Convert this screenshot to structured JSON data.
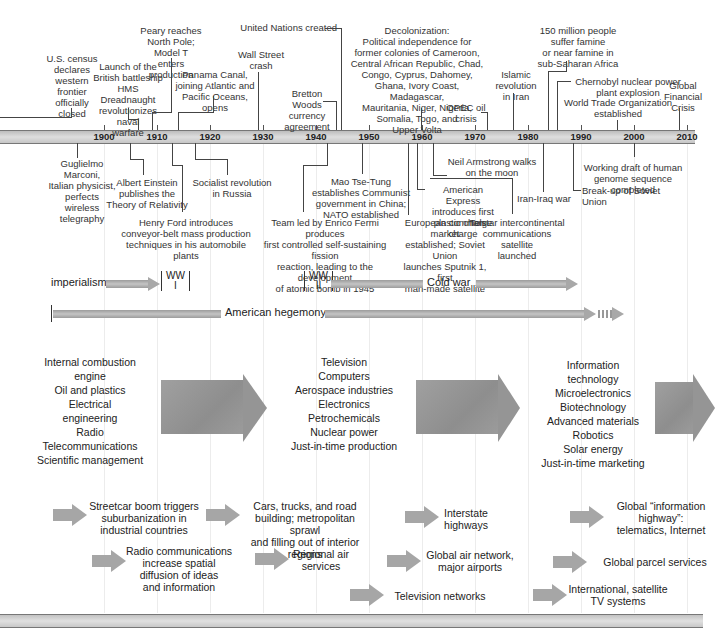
{
  "axis": {
    "years": [
      "1900",
      "1910",
      "1920",
      "1930",
      "1940",
      "1950",
      "1960",
      "1970",
      "1980",
      "1990",
      "2000",
      "2010"
    ]
  },
  "events_above": [
    {
      "text": "U.S. census\ndeclares\nwestern\nfrontier\nofficially\nclosed"
    },
    {
      "text": "Launch of the\nBritish battleship\nHMS Dreadnaught\nrevolutionizes naval\nwarfare"
    },
    {
      "text": "Peary reaches\nNorth Pole;\nModel T enters\nproduction"
    },
    {
      "text": "Panama Canal,\njoining Atlantic and\nPacific Oceans, opens"
    },
    {
      "text": "Wall Street\ncrash"
    },
    {
      "text": "United Nations created"
    },
    {
      "text": "Bretton Woods\ncurrency\nagreement"
    },
    {
      "text": "Decolonization:\nPolitical independence for\nformer colonies of Cameroon,\nCentral African Republic, Chad,\nCongo, Cyprus, Dahomey,\nGhana, Ivory Coast, Madagascar,\nMauritania, Niger, Nigeria,\nSomalia, Togo, and\nUpper Volta"
    },
    {
      "text": "OPEC oil\ncrisis"
    },
    {
      "text": "Islamic\nrevolution\nin Iran"
    },
    {
      "text": "150 million people\nsuffer famine\nor near famine in\nsub-Saharan Africa"
    },
    {
      "text": "Chernobyl nuclear power\nplant explosion"
    },
    {
      "text": "World Trade Organization\nestablished"
    },
    {
      "text": "Global\nFinancial\nCrisis"
    }
  ],
  "events_below": [
    {
      "text": "Guglielmo Marconi,\nItalian physicist,\nperfects\nwireless\ntelegraphy"
    },
    {
      "text": "Albert Einstein\npublishes the\nTheory of Relativity"
    },
    {
      "text": "Socialist revolution\nin Russia"
    },
    {
      "text": "Henry Ford introduces\nconveyor-belt mass production\ntechniques in his automobile plants"
    },
    {
      "text": "Mao Tse-Tung\nestablishes Communist\ngovernment in China;\nNATO established"
    },
    {
      "text": "Team led by Enrico Fermi produces\nfirst controlled self-sustaining fission\nreaction, leading to the development\nof atomic bomb in 1945"
    },
    {
      "text": "Neil Armstrong walks\non the moon"
    },
    {
      "text": "American Express\nintroduces first\nplastic charge charge"
    },
    {
      "text": "European common market\nestablished; Soviet Union\nlaunches Sputnik 1, first\nman-made satellite"
    },
    {
      "text": "Telstar intercontinental\ncommunications satellite\nlaunched"
    },
    {
      "text": "Iran-Iraq war"
    },
    {
      "text": "Working draft of human\ngenome sequence completed"
    },
    {
      "text": "Break-up of Soviet Union"
    }
  ],
  "eras": {
    "imperialism": "imperialism",
    "ww1": "WW\nI",
    "ww2": "WW\nII",
    "cold_war": "Cold war",
    "american_hegemony": "American hegemony"
  },
  "tech_waves": [
    {
      "items": [
        "Internal combustion\nengine",
        "Oil and plastics",
        "Electrical\nengineering",
        "Radio",
        "Telecommunications",
        "Scientific management"
      ]
    },
    {
      "items": [
        "Television",
        "Computers",
        "Aerospace industries",
        "Electronics",
        "Petrochemicals",
        "Nuclear power",
        "Just-in-time production"
      ]
    },
    {
      "items": [
        "Information\ntechnology",
        "Microelectronics",
        "Biotechnology",
        "Advanced materials",
        "Robotics",
        "Solar energy",
        "Just-in-time marketing"
      ]
    }
  ],
  "transport_comm": [
    {
      "text": "Streetcar boom triggers\nsuburbanization in\nindustrial countries"
    },
    {
      "text": "Cars, trucks, and road\nbuilding; metropolitan sprawl\nand filling out of interior regions"
    },
    {
      "text": "Interstate\nhighways"
    },
    {
      "text": "Global “information\nhighway”:\ntelematics, Internet"
    },
    {
      "text": "Radio communications\nincrease spatial\ndiffusion of ideas\nand information"
    },
    {
      "text": "Regional air\nservices"
    },
    {
      "text": "Global air network,\nmajor airports"
    },
    {
      "text": "Global parcel services"
    },
    {
      "text": "Television networks"
    },
    {
      "text": "International, satellite\nTV systems"
    }
  ],
  "colors": {
    "axis_bar": "#cfcfcf",
    "arrow_gray": "#9a9a9a",
    "text": "#2a2a2a",
    "gridline": "#ececec"
  }
}
